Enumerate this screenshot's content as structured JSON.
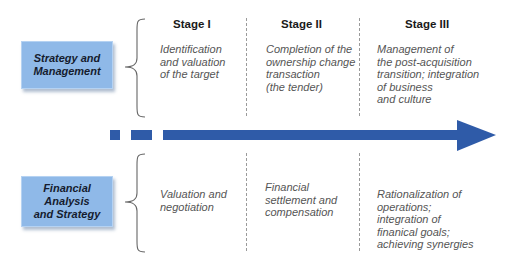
{
  "rows": [
    {
      "label": "Strategy and\nManagement",
      "cells": [
        "Identification\nand valuation\nof the target",
        "Completion of the\nownership change\ntransaction\n(the tender)",
        "Management of\nthe post-acquisition\ntransition; integration\nof business\nand culture"
      ]
    },
    {
      "label": "Financial\nAnalysis\nand Strategy",
      "cells": [
        "Valuation and\nnegotiation",
        "Financial\nsettlement and\ncompensation",
        "Rationalization of\noperations;\nintegration of\nfinanical goals;\nachieving synergies"
      ]
    }
  ],
  "stages": [
    "Stage I",
    "Stage II",
    "Stage III"
  ],
  "colors": {
    "box_fill": "#8fb9e8",
    "arrow": "#2f5ba8",
    "text": "#555555"
  },
  "icons": {
    "brace": "left-curly-brace",
    "arrow": "timeline-arrow-right"
  }
}
